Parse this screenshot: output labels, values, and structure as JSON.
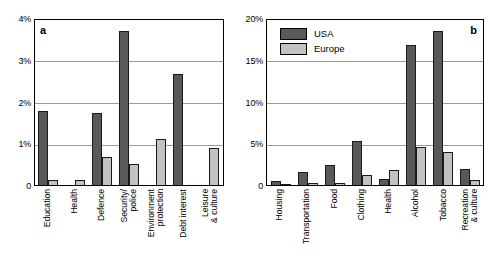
{
  "figure": {
    "background": "#ffffff",
    "usa_color": "#595959",
    "europe_color": "#c2c2c2",
    "axis_color": "#000000",
    "grid_color": "#9a9a9a"
  },
  "legend": {
    "position": "top-left of panel b",
    "entries": [
      {
        "label": "USA",
        "color": "#595959"
      },
      {
        "label": "Europe",
        "color": "#c2c2c2"
      }
    ]
  },
  "panel_a": {
    "letter": "a",
    "yticks": [
      "0",
      "1%",
      "2%",
      "3%",
      "4%"
    ]
  },
  "panel_b": {
    "letter": "b",
    "yticks": [
      "0",
      "5%",
      "10%",
      "15%",
      "20%"
    ]
  },
  "chart_data": [
    {
      "type": "bar",
      "panel": "a",
      "title": "",
      "xlabel": "",
      "ylabel": "",
      "ylim": [
        0,
        4
      ],
      "yticks": [
        0,
        1,
        2,
        3,
        4
      ],
      "ytick_labels": [
        "0",
        "1%",
        "2%",
        "3%",
        "4%"
      ],
      "grid": true,
      "legend": [
        "USA",
        "Europe"
      ],
      "legend_position": "none",
      "categories": [
        "Education",
        "Health",
        "Defence",
        "Security/ police",
        "Environment protection",
        "Debt interest",
        "Leisure & culture"
      ],
      "series": [
        {
          "name": "USA",
          "color": "#595959",
          "values": [
            1.78,
            0.0,
            1.72,
            3.68,
            0.0,
            2.66,
            0.0
          ]
        },
        {
          "name": "Europe",
          "color": "#c2c2c2",
          "values": [
            0.13,
            0.11,
            0.66,
            0.5,
            1.1,
            0.0,
            0.88
          ]
        }
      ]
    },
    {
      "type": "bar",
      "panel": "b",
      "title": "",
      "xlabel": "",
      "ylabel": "",
      "ylim": [
        0,
        20
      ],
      "yticks": [
        0,
        5,
        10,
        15,
        20
      ],
      "ytick_labels": [
        "0",
        "5%",
        "10%",
        "15%",
        "20%"
      ],
      "grid": true,
      "legend": [
        "USA",
        "Europe"
      ],
      "legend_position": "upper-left",
      "categories": [
        "Housing",
        "Transportation",
        "Food",
        "Clothing",
        "Health",
        "Alcohol",
        "Tobacco",
        "Recreation & culture"
      ],
      "series": [
        {
          "name": "USA",
          "color": "#595959",
          "values": [
            0.45,
            1.55,
            2.35,
            5.25,
            0.7,
            16.8,
            18.5,
            1.95
          ]
        },
        {
          "name": "Europe",
          "color": "#c2c2c2",
          "values": [
            0.08,
            0.28,
            0.28,
            1.25,
            1.8,
            4.6,
            3.9,
            0.65
          ]
        }
      ]
    }
  ],
  "categories_a": [
    {
      "lines": [
        "Education"
      ]
    },
    {
      "lines": [
        "Health"
      ]
    },
    {
      "lines": [
        "Defence"
      ]
    },
    {
      "lines": [
        "Security/",
        "police"
      ]
    },
    {
      "lines": [
        "Environment",
        "protection"
      ]
    },
    {
      "lines": [
        "Debt interest"
      ]
    },
    {
      "lines": [
        "Leisure",
        "& culture"
      ]
    }
  ],
  "categories_b": [
    {
      "lines": [
        "Housing"
      ]
    },
    {
      "lines": [
        "Transportation"
      ]
    },
    {
      "lines": [
        "Food"
      ]
    },
    {
      "lines": [
        "Clothing"
      ]
    },
    {
      "lines": [
        "Health"
      ]
    },
    {
      "lines": [
        "Alcohol"
      ]
    },
    {
      "lines": [
        "Tobacco"
      ]
    },
    {
      "lines": [
        "Recreation",
        "& culture"
      ]
    }
  ]
}
